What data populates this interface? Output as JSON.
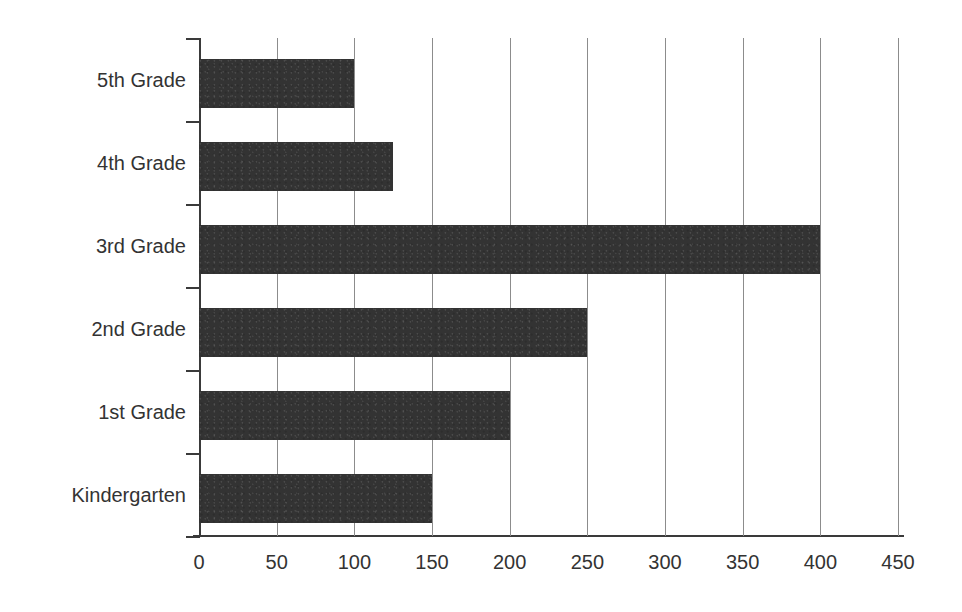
{
  "chart": {
    "title": "",
    "background_color": "#ffffff",
    "bar_color": "#333333",
    "gridline_color": "#8c8c8c",
    "axis_color": "#3a3a3a",
    "text_color": "#333333"
  },
  "chart_data": {
    "type": "bar",
    "orientation": "horizontal",
    "title": "",
    "xlabel": "",
    "ylabel": "",
    "categories": [
      "5th Grade",
      "4th Grade",
      "3rd Grade",
      "2nd Grade",
      "1st Grade",
      "Kindergarten"
    ],
    "values": [
      100,
      125,
      400,
      250,
      200,
      150
    ],
    "xlim": [
      0,
      450
    ],
    "xticks": [
      0,
      50,
      100,
      150,
      200,
      250,
      300,
      350,
      400,
      450
    ],
    "xtick_labels": [
      "0",
      "50",
      "100",
      "150",
      "200",
      "250",
      "300",
      "350",
      "400",
      "450"
    ],
    "grid": true,
    "grid_axis": "x",
    "legend": false,
    "legend_position": "none",
    "series": [
      {
        "name": "",
        "values": [
          100,
          125,
          400,
          250,
          200,
          150
        ]
      }
    ]
  }
}
